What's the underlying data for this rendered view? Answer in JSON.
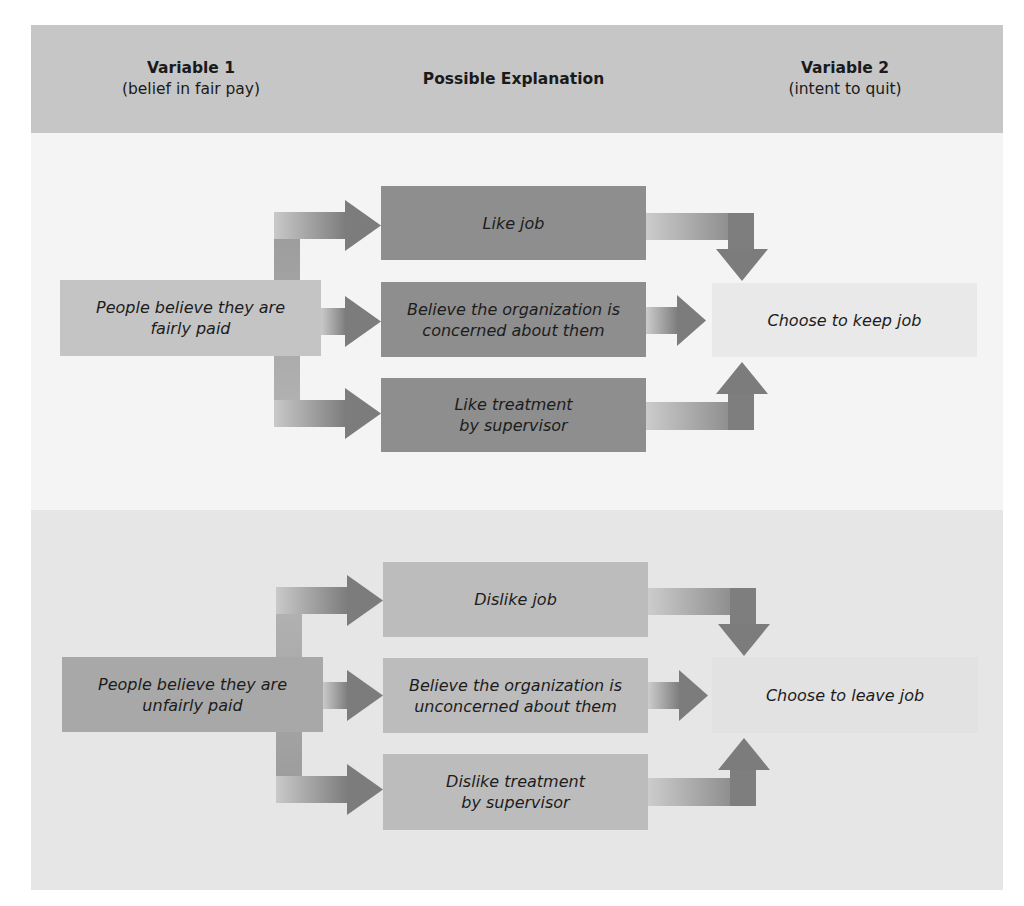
{
  "header": {
    "columns": [
      {
        "title": "Variable 1",
        "subtitle": "(belief in fair pay)"
      },
      {
        "title": "Possible Explanation",
        "subtitle": ""
      },
      {
        "title": "Variable 2",
        "subtitle": "(intent to quit)"
      }
    ]
  },
  "sections": {
    "top": {
      "source": "People believe they are fairly paid",
      "explanations": [
        "Like job",
        "Believe the organization is concerned about them",
        "Like treatment by supervisor"
      ],
      "outcome": "Choose to keep job"
    },
    "bottom": {
      "source": "People believe they are unfairly paid",
      "explanations": [
        "Dislike job",
        "Believe the organization is unconcerned about them",
        "Dislike treatment by supervisor"
      ],
      "outcome": "Choose to leave job"
    }
  },
  "colors": {
    "header_bg": "#c6c6c6",
    "top_section_bg": "#f4f4f4",
    "bottom_section_bg": "#e6e6e6",
    "top_explanation_box": "#8e8e8e",
    "bottom_explanation_box": "#bcbcbc",
    "arrow_dark": "#7a7a7a",
    "arrow_light": "#c8c8c8"
  }
}
